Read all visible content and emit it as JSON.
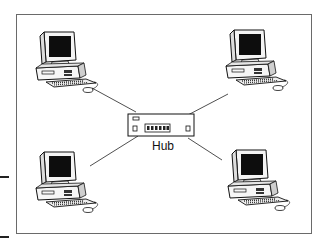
{
  "diagram": {
    "title": "",
    "hub_label": "Hub",
    "topology": "star",
    "nodes": [
      {
        "id": "pc-top-left",
        "type": "computer"
      },
      {
        "id": "pc-top-right",
        "type": "computer"
      },
      {
        "id": "pc-bottom-left",
        "type": "computer"
      },
      {
        "id": "pc-bottom-right",
        "type": "computer"
      },
      {
        "id": "hub",
        "type": "hub",
        "label": "Hub"
      }
    ],
    "edges": [
      [
        "pc-top-left",
        "hub"
      ],
      [
        "pc-top-right",
        "hub"
      ],
      [
        "pc-bottom-left",
        "hub"
      ],
      [
        "pc-bottom-right",
        "hub"
      ]
    ]
  }
}
